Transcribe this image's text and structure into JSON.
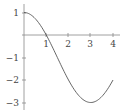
{
  "chart_data": {
    "type": "line",
    "title": "",
    "xlabel": "",
    "ylabel": "",
    "xlim": [
      0,
      4
    ],
    "ylim": [
      -3,
      1
    ],
    "x_ticks": [
      "1",
      "2",
      "3",
      "4"
    ],
    "y_ticks": [
      "1",
      "−1",
      "−2",
      "−3"
    ],
    "grid": false,
    "legend": null,
    "function": "y = 2cos(pi*x/3) - 1",
    "series": [
      {
        "name": "f(x)",
        "color": "#555555",
        "x": [
          0,
          0.5,
          1,
          1.5,
          2,
          2.5,
          3,
          3.5,
          4
        ],
        "values": [
          1,
          0.73,
          0,
          -1,
          -2,
          -2.73,
          -3,
          -2.73,
          -2
        ]
      }
    ]
  }
}
